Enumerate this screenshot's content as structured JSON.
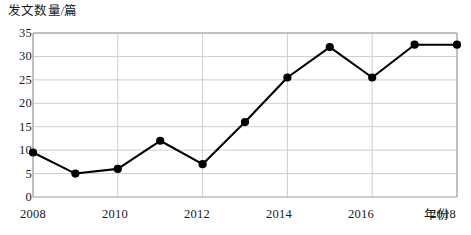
{
  "chart_data": {
    "type": "line",
    "title": "",
    "ylabel": "发文数量/篇",
    "xlabel": "年份",
    "x": [
      2008,
      2009,
      2010,
      2011,
      2012,
      2013,
      2014,
      2015,
      2016,
      2017,
      2018
    ],
    "values": [
      9.5,
      5,
      6,
      12,
      7,
      16,
      25.5,
      32,
      25.5,
      32.5,
      32.5
    ],
    "series": [
      {
        "name": "发文数量",
        "values": [
          9.5,
          5,
          6,
          12,
          7,
          16,
          25.5,
          32,
          25.5,
          32.5,
          32.5
        ]
      }
    ],
    "xlim": [
      2008,
      2018
    ],
    "ylim": [
      0,
      35
    ],
    "yticks": [
      0,
      5,
      10,
      15,
      20,
      25,
      30,
      35
    ],
    "ytick_labels": [
      "0",
      "5",
      "10",
      "15",
      "20",
      "25",
      "30",
      "35"
    ],
    "xticks": [
      2008,
      2010,
      2012,
      2014,
      2016,
      2018
    ],
    "xtick_labels": [
      "2008",
      "2010",
      "2012",
      "2014",
      "2016",
      "2018"
    ],
    "grid": true,
    "legend": "none",
    "line_color": "#000000",
    "marker_color": "#000000",
    "grid_color": "#c8c8c8",
    "axis_color": "#9a9a9a"
  }
}
